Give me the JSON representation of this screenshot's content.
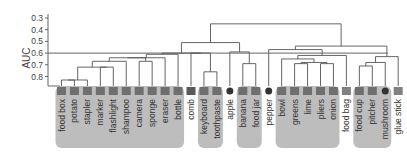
{
  "chart_data": {
    "type": "dendrogram",
    "title": "",
    "xlabel": "",
    "ylabel": "AUC",
    "ylim": [
      0.25,
      0.87
    ],
    "y_inverted": true,
    "yticks": [
      0.3,
      0.4,
      0.5,
      0.6,
      0.7,
      0.8
    ],
    "ytick_labels": [
      "0.3",
      "0.4",
      "0.5",
      "0.6",
      "0.7",
      "0.8"
    ],
    "threshold_line": 0.6,
    "grid": false,
    "leaves": [
      "food box",
      "potato",
      "stapler",
      "marker",
      "flashlight",
      "shampoo",
      "camera",
      "sponge",
      "eraser",
      "bottle",
      "comb",
      "keyboard",
      "toothpaste",
      "apple",
      "banana",
      "food jar",
      "pepper",
      "bowl",
      "greens",
      "lime",
      "pliers",
      "onion",
      "food bag",
      "food cup",
      "pitcher",
      "mushroom",
      "glue stick"
    ],
    "clusters": [
      {
        "name": "cluster-1",
        "members": [
          "food box",
          "potato",
          "stapler",
          "marker",
          "flashlight",
          "shampoo",
          "camera",
          "sponge",
          "eraser",
          "bottle"
        ]
      },
      {
        "name": "cluster-2",
        "members": [
          "keyboard",
          "toothpaste"
        ]
      },
      {
        "name": "cluster-3",
        "members": [
          "banana",
          "food jar"
        ]
      },
      {
        "name": "cluster-4",
        "members": [
          "bowl",
          "greens",
          "lime",
          "pliers",
          "onion"
        ]
      },
      {
        "name": "cluster-5",
        "members": [
          "food cup",
          "pitcher",
          "mushroom"
        ]
      }
    ],
    "merges": [
      {
        "left": "food box",
        "right": "potato",
        "height": 0.83
      },
      {
        "left": "[food box,potato]",
        "right": "stapler",
        "height": 0.83
      },
      {
        "left": "[food box..stapler]",
        "right": "[marker,flashlight]",
        "height": 0.72
      },
      {
        "left": "...",
        "right": "shampoo",
        "height": 0.67
      },
      {
        "left": "...",
        "right": "[camera..bottle]",
        "height": 0.64
      },
      {
        "left": "cluster-1",
        "right": "comb+keyboard+toothpaste",
        "height": 0.6
      },
      {
        "left": "keyboard",
        "right": "toothpaste",
        "height": 0.76
      },
      {
        "left": "banana",
        "right": "food jar",
        "height": 0.69
      },
      {
        "left": "apple",
        "right": "[banana,food jar]",
        "height": 0.59
      },
      {
        "left": "left group",
        "right": "[apple,banana,food jar]",
        "height": 0.51
      },
      {
        "left": "greens",
        "right": "lime",
        "height": 0.69
      },
      {
        "left": "pliers",
        "right": "onion",
        "height": 0.69
      },
      {
        "left": "[greens,lime]",
        "right": "[pliers,onion]",
        "height": 0.68
      },
      {
        "left": "bowl",
        "right": "[greens..onion]",
        "height": 0.65
      },
      {
        "left": "[bowl..onion]",
        "right": "food bag",
        "height": 0.62
      },
      {
        "left": "food cup",
        "right": "pitcher",
        "height": 0.71
      },
      {
        "left": "[food cup,pitcher]",
        "right": "mushroom",
        "height": 0.68
      },
      {
        "left": "...",
        "right": "glue stick",
        "height": 0.63
      },
      {
        "left": "pepper",
        "right": "[bowl..food bag]",
        "height": 0.57
      },
      {
        "left": "...",
        "right": "[food cup..glue stick]",
        "height": 0.54
      },
      {
        "left": "root-left",
        "right": "root-right",
        "height": 0.35
      }
    ]
  },
  "axis": {
    "ylabel": "AUC",
    "ticks": [
      "0.3",
      "0.4",
      "0.5",
      "0.6",
      "0.7",
      "0.8"
    ]
  },
  "colors": {
    "line": "#555555",
    "cluster_fill": "#bdbdbd",
    "text": "#333333"
  }
}
